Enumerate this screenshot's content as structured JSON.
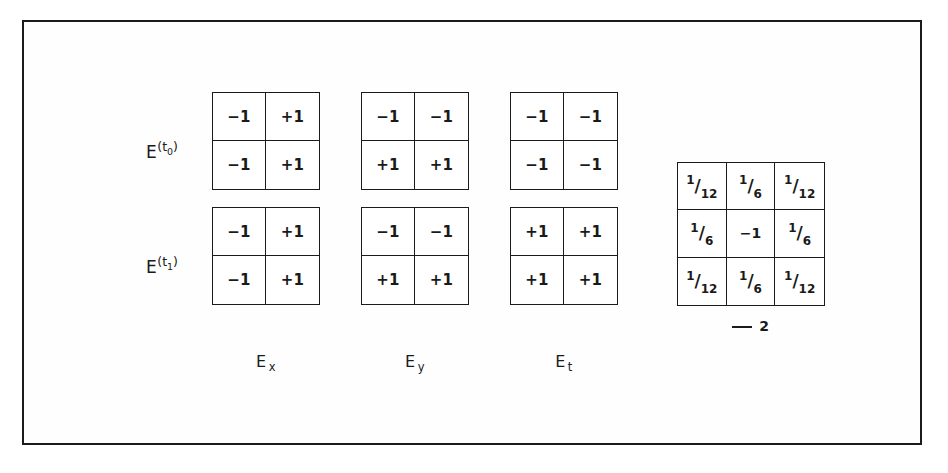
{
  "figure": {
    "background_color": "#ffffff",
    "border_color": "#1b1b1b",
    "ink_color": "#1a1a1a"
  },
  "rows": [
    {
      "label_base": "E",
      "label_sup_open": "(t",
      "label_sup_sub": "0",
      "label_sup_close": ")"
    },
    {
      "label_base": "E",
      "label_sup_open": "(t",
      "label_sup_sub": "1",
      "label_sup_close": ")"
    }
  ],
  "columns": [
    {
      "caption_base": "E",
      "caption_sub": "x"
    },
    {
      "caption_base": "E",
      "caption_sub": "y"
    },
    {
      "caption_base": "E",
      "caption_sub": "t"
    }
  ],
  "kernels_2x2": [
    {
      "name": "Ex-t0",
      "row": 0,
      "column": 0,
      "cells": [
        "−1",
        "+1",
        "−1",
        "+1"
      ]
    },
    {
      "name": "Ey-t0",
      "row": 0,
      "column": 1,
      "cells": [
        "−1",
        "−1",
        "+1",
        "+1"
      ]
    },
    {
      "name": "Et-t0",
      "row": 0,
      "column": 2,
      "cells": [
        "−1",
        "−1",
        "−1",
        "−1"
      ]
    },
    {
      "name": "Ex-t1",
      "row": 1,
      "column": 0,
      "cells": [
        "−1",
        "+1",
        "−1",
        "+1"
      ]
    },
    {
      "name": "Ey-t1",
      "row": 1,
      "column": 1,
      "cells": [
        "−1",
        "−1",
        "+1",
        "+1"
      ]
    },
    {
      "name": "Et-t1",
      "row": 1,
      "column": 2,
      "cells": [
        "+1",
        "+1",
        "+1",
        "+1"
      ]
    }
  ],
  "laplacian": {
    "cells": [
      {
        "type": "fraction",
        "num": "1",
        "slash": "/",
        "den": "12"
      },
      {
        "type": "fraction",
        "num": "1",
        "slash": "/",
        "den": "6"
      },
      {
        "type": "fraction",
        "num": "1",
        "slash": "/",
        "den": "12"
      },
      {
        "type": "fraction",
        "num": "1",
        "slash": "/",
        "den": "6"
      },
      {
        "type": "plain",
        "text": "−1"
      },
      {
        "type": "fraction",
        "num": "1",
        "slash": "/",
        "den": "6"
      },
      {
        "type": "fraction",
        "num": "1",
        "slash": "/",
        "den": "12"
      },
      {
        "type": "fraction",
        "num": "1",
        "slash": "/",
        "den": "6"
      },
      {
        "type": "fraction",
        "num": "1",
        "slash": "/",
        "den": "12"
      }
    ],
    "caption_exponent": "2"
  }
}
